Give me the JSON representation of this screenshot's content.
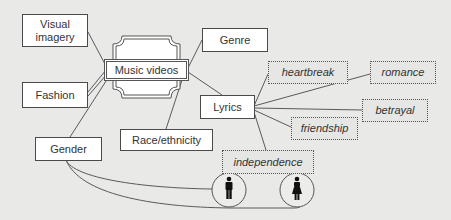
{
  "diagram": {
    "central": {
      "label": "Music videos"
    },
    "categories": [
      {
        "id": "visual",
        "label": "Visual imagery"
      },
      {
        "id": "fashion",
        "label": "Fashion"
      },
      {
        "id": "gender",
        "label": "Gender"
      },
      {
        "id": "genre",
        "label": "Genre"
      },
      {
        "id": "lyrics",
        "label": "Lyrics"
      },
      {
        "id": "race",
        "label": "Race/ethnicity"
      }
    ],
    "lyric_themes": [
      {
        "id": "heartbreak",
        "label": "heartbreak"
      },
      {
        "id": "romance",
        "label": "romance"
      },
      {
        "id": "betrayal",
        "label": "betrayal"
      },
      {
        "id": "friendship",
        "label": "friendship"
      },
      {
        "id": "independence",
        "label": "independence"
      }
    ],
    "gender_icons": [
      {
        "id": "male",
        "icon": "male-figure-icon"
      },
      {
        "id": "female",
        "icon": "female-figure-icon"
      }
    ],
    "colors": {
      "background": "#e9e9e7",
      "line": "#555555",
      "box_fill": "#ffffff",
      "figure": "#111111"
    }
  }
}
